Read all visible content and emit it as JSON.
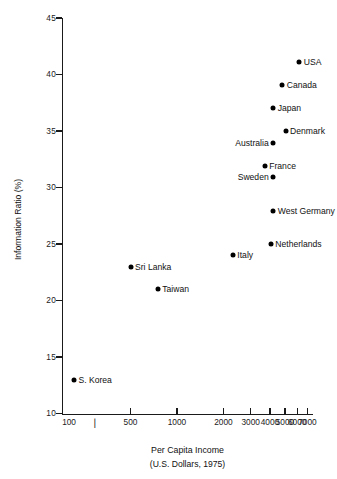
{
  "chart_data": {
    "type": "scatter",
    "title": "",
    "xlabel": "Per Capita Income",
    "xlabel_sub": "(U.S. Dollars, 1975)",
    "ylabel": "Information Ratio (%)",
    "xscale": "log",
    "yscale": "linear",
    "xlim": [
      180,
      7600
    ],
    "ylim": [
      10,
      45
    ],
    "grid": false,
    "legend": "none",
    "xticks": [
      {
        "value": 500,
        "label": "500"
      },
      {
        "value": 1000,
        "label": "1000"
      },
      {
        "value": 2000,
        "label": "2000"
      },
      {
        "value": 3000,
        "label": "3000"
      },
      {
        "value": 4000,
        "label": "4000"
      },
      {
        "value": 5000,
        "label": "5000"
      },
      {
        "value": 6000,
        "label": "6000"
      },
      {
        "value": 7000,
        "label": "7000"
      }
    ],
    "xtick_extra_labels": [
      {
        "value": 200,
        "label": "100"
      }
    ],
    "xminor_marks": [
      {
        "value": 280,
        "glyph": "▕"
      }
    ],
    "yticks": [
      {
        "value": 10,
        "label": "10"
      },
      {
        "value": 15,
        "label": "15"
      },
      {
        "value": 20,
        "label": "20"
      },
      {
        "value": 25,
        "label": "25"
      },
      {
        "value": 30,
        "label": "30"
      },
      {
        "value": 35,
        "label": "35"
      },
      {
        "value": 40,
        "label": "40"
      },
      {
        "value": 45,
        "label": "45"
      }
    ],
    "points": [
      {
        "label": "USA",
        "x": 6200,
        "y": 41.1,
        "side": "right"
      },
      {
        "label": "Canada",
        "x": 4800,
        "y": 39.1,
        "side": "right"
      },
      {
        "label": "Japan",
        "x": 4200,
        "y": 37.0,
        "side": "right"
      },
      {
        "label": "Denmark",
        "x": 5050,
        "y": 35.0,
        "side": "right"
      },
      {
        "label": "Australia",
        "x": 4200,
        "y": 33.9,
        "side": "left"
      },
      {
        "label": "France",
        "x": 3700,
        "y": 31.9,
        "side": "right"
      },
      {
        "label": "Sweden",
        "x": 4200,
        "y": 30.9,
        "side": "left"
      },
      {
        "label": "West Germany",
        "x": 4200,
        "y": 27.9,
        "side": "right"
      },
      {
        "label": "Netherlands",
        "x": 4050,
        "y": 25.0,
        "side": "right"
      },
      {
        "label": "Italy",
        "x": 2300,
        "y": 24.0,
        "side": "right"
      },
      {
        "label": "Sri Lanka",
        "x": 500,
        "y": 23.0,
        "side": "right"
      },
      {
        "label": "Taiwan",
        "x": 750,
        "y": 21.0,
        "side": "right"
      },
      {
        "label": "S. Korea",
        "x": 215,
        "y": 13.0,
        "side": "right"
      }
    ],
    "colors": {
      "marker": "#000000",
      "axis": "#1a1a1a",
      "text": "#111111",
      "background": "#ffffff"
    }
  }
}
